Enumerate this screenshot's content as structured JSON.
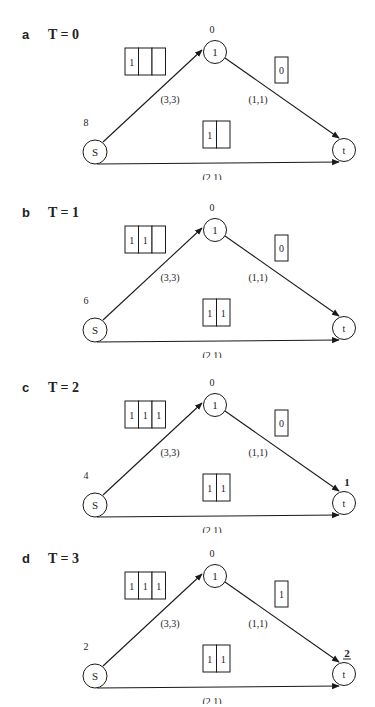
{
  "panels": [
    {
      "letter": "a",
      "title": "T = 0",
      "node1": {
        "label": "1",
        "value": "0"
      },
      "source": {
        "label": "S",
        "value": "8"
      },
      "sink": {
        "label": "t",
        "value": "",
        "underline": false
      },
      "edges": {
        "s_to_1": {
          "label": "(3,3)",
          "queue": [
            "1",
            "",
            ""
          ]
        },
        "one_to_t": {
          "label": "(1,1)",
          "queue": [
            "0"
          ]
        },
        "s_to_t": {
          "label": "(2,1)",
          "queue": [
            "1",
            ""
          ]
        }
      }
    },
    {
      "letter": "b",
      "title": "T = 1",
      "node1": {
        "label": "1",
        "value": "0"
      },
      "source": {
        "label": "S",
        "value": "6"
      },
      "sink": {
        "label": "t",
        "value": "",
        "underline": false
      },
      "edges": {
        "s_to_1": {
          "label": "(3,3)",
          "queue": [
            "1",
            "1",
            ""
          ]
        },
        "one_to_t": {
          "label": "(1,1)",
          "queue": [
            "0"
          ]
        },
        "s_to_t": {
          "label": "(2,1)",
          "queue": [
            "1",
            "1"
          ]
        }
      }
    },
    {
      "letter": "c",
      "title": "T = 2",
      "node1": {
        "label": "1",
        "value": "0"
      },
      "source": {
        "label": "S",
        "value": "4"
      },
      "sink": {
        "label": "t",
        "value": "1",
        "underline": false
      },
      "edges": {
        "s_to_1": {
          "label": "(3,3)",
          "queue": [
            "1",
            "1",
            "1"
          ]
        },
        "one_to_t": {
          "label": "(1,1)",
          "queue": [
            "0"
          ]
        },
        "s_to_t": {
          "label": "(2,1)",
          "queue": [
            "1",
            "1"
          ]
        }
      }
    },
    {
      "letter": "d",
      "title": "T = 3",
      "node1": {
        "label": "1",
        "value": "0"
      },
      "source": {
        "label": "S",
        "value": "2"
      },
      "sink": {
        "label": "t",
        "value": "2",
        "underline": true
      },
      "edges": {
        "s_to_1": {
          "label": "(3,3)",
          "queue": [
            "1",
            "1",
            "1"
          ]
        },
        "one_to_t": {
          "label": "(1,1)",
          "queue": [
            "1"
          ]
        },
        "s_to_t": {
          "label": "(2,1)",
          "queue": [
            "1",
            "1"
          ]
        }
      }
    }
  ],
  "colors": {
    "stroke": "#1a1a1a",
    "text": "#222222",
    "background": "#ffffff"
  }
}
